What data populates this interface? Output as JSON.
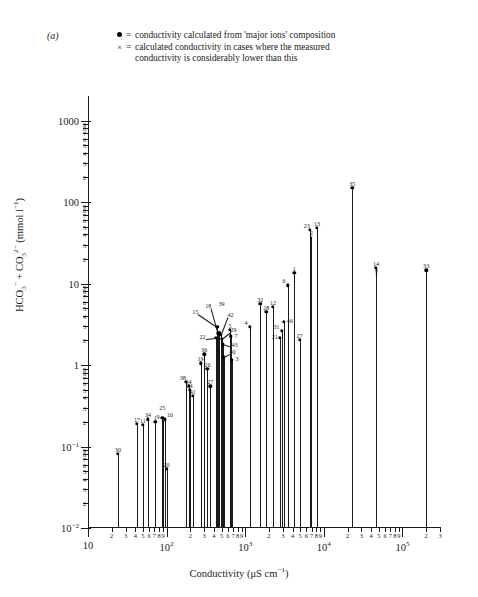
{
  "panel": {
    "label": "(a)"
  },
  "legend": {
    "dot_marker": "dot-filled",
    "x_marker": "×",
    "equals": "=",
    "dot_text": "conductivity calculated from 'major ions' composition",
    "x_text": "calculated conductivity in cases where the measured",
    "x_text_cont": "conductivity is considerably lower than this"
  },
  "chart_data": {
    "type": "bar",
    "title": "",
    "xlabel": "Conductivity (μS cm⁻¹)",
    "ylabel": "HCO₃⁻ + CO₃²⁻ (mmol l⁻¹)",
    "xscale": "log",
    "yscale": "log",
    "xlim": [
      10,
      300000
    ],
    "ylim": [
      0.01,
      2000
    ],
    "grid": false,
    "legend_position": "top",
    "x_major_ticks": [
      "10",
      "10²",
      "10³",
      "10⁴",
      "10⁵"
    ],
    "x_major_values": [
      10,
      100,
      1000,
      10000,
      100000
    ],
    "y_major_ticks": [
      "1000",
      "100",
      "10",
      "1",
      "10⁻¹",
      "10⁻²"
    ],
    "y_major_values": [
      1000,
      100,
      10,
      1,
      0.1,
      0.01
    ],
    "minor_tick_digits": [
      "2",
      "3",
      "4",
      "5",
      "6",
      "7",
      "8",
      "9"
    ],
    "series_note": "Each vertical stem is one water sample; label is the sample number.",
    "points": [
      {
        "id": "30",
        "x": 24,
        "y": 0.082,
        "marker": "dot",
        "label_dx": 0,
        "label_dy": -7
      },
      {
        "id": "17",
        "x": 42,
        "y": 0.19,
        "marker": "dot",
        "label_dx": 0,
        "label_dy": -7
      },
      {
        "id": "11",
        "x": 50,
        "y": 0.185,
        "marker": "dot",
        "label_dx": 0,
        "label_dy": -7
      },
      {
        "id": "34",
        "x": 58,
        "y": 0.215,
        "marker": "dot",
        "label_dx": 0,
        "label_dy": -7
      },
      {
        "id": "1",
        "x": 72,
        "y": 0.2,
        "marker": "dot",
        "label_dx": 0,
        "label_dy": -7
      },
      {
        "id": "25",
        "x": 88,
        "y": 0.225,
        "marker": "dot",
        "label_dx": 0,
        "label_dy": -13
      },
      {
        "id": "9",
        "x": 90,
        "y": 0.205,
        "marker": "x",
        "label_dx": -5,
        "label_dy": -7
      },
      {
        "id": "10",
        "x": 95,
        "y": 0.215,
        "marker": "dot",
        "label_dx": 5,
        "label_dy": -7
      },
      {
        "id": "20",
        "x": 100,
        "y": 0.053,
        "marker": "dot",
        "label_dx": 0,
        "label_dy": -7
      },
      {
        "id": "38",
        "x": 175,
        "y": 0.62,
        "marker": "dot",
        "label_dx": -3,
        "label_dy": -7
      },
      {
        "id": "44",
        "x": 190,
        "y": 0.56,
        "marker": "dot",
        "label_dx": 0,
        "label_dy": -7
      },
      {
        "id": "24",
        "x": 196,
        "y": 0.5,
        "marker": "dot",
        "label_dx": 0,
        "label_dy": -7
      },
      {
        "id": "41",
        "x": 215,
        "y": 0.42,
        "marker": "dot",
        "label_dx": 0,
        "label_dy": -7
      },
      {
        "id": "19",
        "x": 270,
        "y": 1.05,
        "marker": "dot",
        "label_dx": 0,
        "label_dy": -7
      },
      {
        "id": "36",
        "x": 300,
        "y": 1.35,
        "marker": "dot",
        "label_dx": 0,
        "label_dy": -7
      },
      {
        "id": "26",
        "x": 330,
        "y": 0.9,
        "marker": "dot",
        "label_dx": 0,
        "label_dy": -7
      },
      {
        "id": "27b",
        "x": 360,
        "y": 0.55,
        "marker": "dot",
        "label_dx": 0,
        "label_dy": -7
      },
      {
        "id": "22",
        "x": 420,
        "y": 2.15,
        "marker": "dot",
        "label_dx": -13,
        "label_dy": -4
      },
      {
        "id": "15",
        "x": 440,
        "y": 2.95,
        "marker": "dot",
        "label_dx": -22,
        "label_dy": -18
      },
      {
        "id": "18",
        "x": 455,
        "y": 2.45,
        "marker": "dot",
        "label_dx": -10,
        "label_dy": -30
      },
      {
        "id": "39",
        "x": 470,
        "y": 2.5,
        "marker": "dot",
        "label_dx": 2,
        "label_dy": -32
      },
      {
        "id": "42",
        "x": 485,
        "y": 2.35,
        "marker": "dot",
        "label_dx": 10,
        "label_dy": -23
      },
      {
        "id": "29",
        "x": 500,
        "y": 2.1,
        "marker": "dot",
        "label_dx": 12,
        "label_dy": -12
      },
      {
        "id": "43",
        "x": 515,
        "y": 1.8,
        "marker": "dot",
        "label_dx": 12,
        "label_dy": -2
      },
      {
        "id": "40",
        "x": 530,
        "y": 1.25,
        "marker": "dot",
        "label_dx": 9,
        "label_dy": -8
      },
      {
        "id": "5",
        "x": 640,
        "y": 2.7,
        "marker": "dot",
        "label_dx": 0,
        "label_dy": -7
      },
      {
        "id": "7",
        "x": 660,
        "y": 2.25,
        "marker": "dot",
        "label_dx": 5,
        "label_dy": -3
      },
      {
        "id": "3",
        "x": 680,
        "y": 1.15,
        "marker": "dot",
        "label_dx": 5,
        "label_dy": -4
      },
      {
        "id": "4",
        "x": 1150,
        "y": 2.95,
        "marker": "dot",
        "label_dx": -4,
        "label_dy": -7
      },
      {
        "id": "32",
        "x": 1550,
        "y": 5.6,
        "marker": "dot",
        "label_dx": 0,
        "label_dy": -7
      },
      {
        "id": "28",
        "x": 1850,
        "y": 4.5,
        "marker": "dot",
        "label_dx": 0,
        "label_dy": -7
      },
      {
        "id": "12",
        "x": 2250,
        "y": 5.2,
        "marker": "dot",
        "label_dx": 0,
        "label_dy": -7
      },
      {
        "id": "21",
        "x": 2750,
        "y": 2.15,
        "marker": "dot",
        "label_dx": -5,
        "label_dy": -4
      },
      {
        "id": "31",
        "x": 2900,
        "y": 2.65,
        "marker": "dot",
        "label_dx": -5,
        "label_dy": -7
      },
      {
        "id": "46",
        "x": 3100,
        "y": 3.4,
        "marker": "dot",
        "label_dx": 6,
        "label_dy": -4
      },
      {
        "id": "6",
        "x": 3500,
        "y": 9.5,
        "marker": "dot",
        "label_dx": -4,
        "label_dy": -7
      },
      {
        "id": "1b",
        "x": 4200,
        "y": 13.5,
        "marker": "dot",
        "label_dx": 0,
        "label_dy": -7
      },
      {
        "id": "27",
        "x": 4900,
        "y": 2.05,
        "marker": "dot",
        "label_dx": 0,
        "label_dy": -7
      },
      {
        "id": "23",
        "x": 6600,
        "y": 46,
        "marker": "dot",
        "label_dx": -3,
        "label_dy": -7
      },
      {
        "id": "2",
        "x": 6900,
        "y": 37,
        "marker": "x",
        "label_dx": 0,
        "label_dy": -7
      },
      {
        "id": "13",
        "x": 8200,
        "y": 48,
        "marker": "dot",
        "label_dx": 0,
        "label_dy": -7
      },
      {
        "id": "35",
        "x": 23000,
        "y": 150,
        "marker": "dot",
        "label_dx": 0,
        "label_dy": -7
      },
      {
        "id": "14",
        "x": 46000,
        "y": 15.5,
        "marker": "dot",
        "label_dx": 0,
        "label_dy": -7
      },
      {
        "id": "8",
        "x": 46500,
        "y": 13.0,
        "marker": "x",
        "label_dx": 0,
        "label_dy": -7
      },
      {
        "id": "33",
        "x": 200000,
        "y": 14.5,
        "marker": "dot",
        "label_dx": 0,
        "label_dy": -7
      }
    ]
  }
}
